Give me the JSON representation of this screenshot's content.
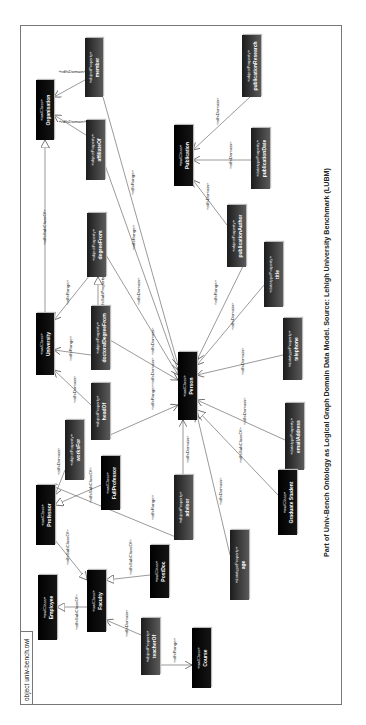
{
  "frame": {
    "title": "object univ-bench.owl"
  },
  "caption": "Part of Univ-Bench Ontology as Logical Graph Domain Data Model. Source: Lehigh University Benchmark (LUBM)",
  "stereotypes": {
    "class": "«owlClass»",
    "object_property": "«objectProperty»",
    "datatype_property": "«datatypeProperty»"
  },
  "nodes": {
    "organisation": {
      "type": "class",
      "name": "Organisation"
    },
    "member": {
      "type": "object_property",
      "name": "member"
    },
    "affiliateOf": {
      "type": "object_property",
      "name": "affiliateOf"
    },
    "university": {
      "type": "class",
      "name": "University"
    },
    "degreeFrom": {
      "type": "object_property",
      "name": "degreeFrom"
    },
    "doctoralDegreeFrom": {
      "type": "object_property",
      "name": "doctoralDegreeFrom"
    },
    "headOf": {
      "type": "object_property",
      "name": "headOf"
    },
    "person": {
      "type": "class",
      "name": "Person"
    },
    "publication": {
      "type": "class",
      "name": "Publication"
    },
    "publicationResearch": {
      "type": "object_property",
      "name": "publicationResearch"
    },
    "publicationDate": {
      "type": "datatype_property",
      "name": "publicationDate"
    },
    "publicationAuthor": {
      "type": "object_property",
      "name": "publicationAuthor"
    },
    "title": {
      "type": "datatype_property",
      "name": "title"
    },
    "telephone": {
      "type": "datatype_property",
      "name": "telephone"
    },
    "emailAddress": {
      "type": "datatype_property",
      "name": "emailAddress"
    },
    "graduateStudent": {
      "type": "class",
      "name": "Graduate Student"
    },
    "age": {
      "type": "datatype_property",
      "name": "age"
    },
    "advisor": {
      "type": "object_property",
      "name": "advisor"
    },
    "worksFor": {
      "type": "object_property",
      "name": "worksFor"
    },
    "fullProfessor": {
      "type": "class",
      "name": "FullProfessor"
    },
    "professor": {
      "type": "class",
      "name": "Professor"
    },
    "postDoc": {
      "type": "class",
      "name": "PostDoc"
    },
    "faculty": {
      "type": "class",
      "name": "Faculty"
    },
    "employee": {
      "type": "class",
      "name": "Employee"
    },
    "teacherOf": {
      "type": "object_property",
      "name": "teacherOf"
    },
    "course": {
      "type": "class",
      "name": "Course"
    }
  },
  "edge_labels": {
    "domain": "«rdfsDomain»",
    "range": "«rdfsRange»",
    "subclass": "«rdfsSubClassOf»",
    "subproperty": "«rdfsSubPropertyOf»"
  },
  "edges": [
    {
      "from": "member",
      "to": "organisation",
      "label": "domain"
    },
    {
      "from": "member",
      "to": "person",
      "label": "range"
    },
    {
      "from": "affiliateOf",
      "to": "organisation",
      "label": "domain"
    },
    {
      "from": "affiliateOf",
      "to": "person",
      "label": "range"
    },
    {
      "from": "university",
      "to": "organisation",
      "label": "subclass"
    },
    {
      "from": "degreeFrom",
      "to": "university",
      "label": "range"
    },
    {
      "from": "degreeFrom",
      "to": "person",
      "label": "domain"
    },
    {
      "from": "doctoralDegreeFrom",
      "to": "degreeFrom",
      "label": "subproperty"
    },
    {
      "from": "doctoralDegreeFrom",
      "to": "university",
      "label": "range"
    },
    {
      "from": "doctoralDegreeFrom",
      "to": "person",
      "label": "domain"
    },
    {
      "from": "headOf",
      "to": "university",
      "label": "domain"
    },
    {
      "from": "headOf",
      "to": "person",
      "label": "range"
    },
    {
      "from": "publicationResearch",
      "to": "publication",
      "label": "domain"
    },
    {
      "from": "publicationDate",
      "to": "publication",
      "label": "domain"
    },
    {
      "from": "publicationAuthor",
      "to": "publication",
      "label": "domain"
    },
    {
      "from": "publicationAuthor",
      "to": "person",
      "label": "range"
    },
    {
      "from": "title",
      "to": "person",
      "label": "domain"
    },
    {
      "from": "telephone",
      "to": "person",
      "label": "domain"
    },
    {
      "from": "emailAddress",
      "to": "person",
      "label": "domain"
    },
    {
      "from": "graduateStudent",
      "to": "person",
      "label": "subclass"
    },
    {
      "from": "age",
      "to": "person",
      "label": "domain"
    },
    {
      "from": "advisor",
      "to": "person",
      "label": "domain"
    },
    {
      "from": "advisor",
      "to": "professor",
      "label": "range"
    },
    {
      "from": "worksFor",
      "to": "professor",
      "label": "domain"
    },
    {
      "from": "fullProfessor",
      "to": "professor",
      "label": "subclass"
    },
    {
      "from": "professor",
      "to": "faculty",
      "label": "subclass"
    },
    {
      "from": "postDoc",
      "to": "faculty",
      "label": "subclass"
    },
    {
      "from": "faculty",
      "to": "employee",
      "label": "subclass"
    },
    {
      "from": "teacherOf",
      "to": "faculty",
      "label": "domain"
    },
    {
      "from": "teacherOf",
      "to": "course",
      "label": "range"
    }
  ]
}
